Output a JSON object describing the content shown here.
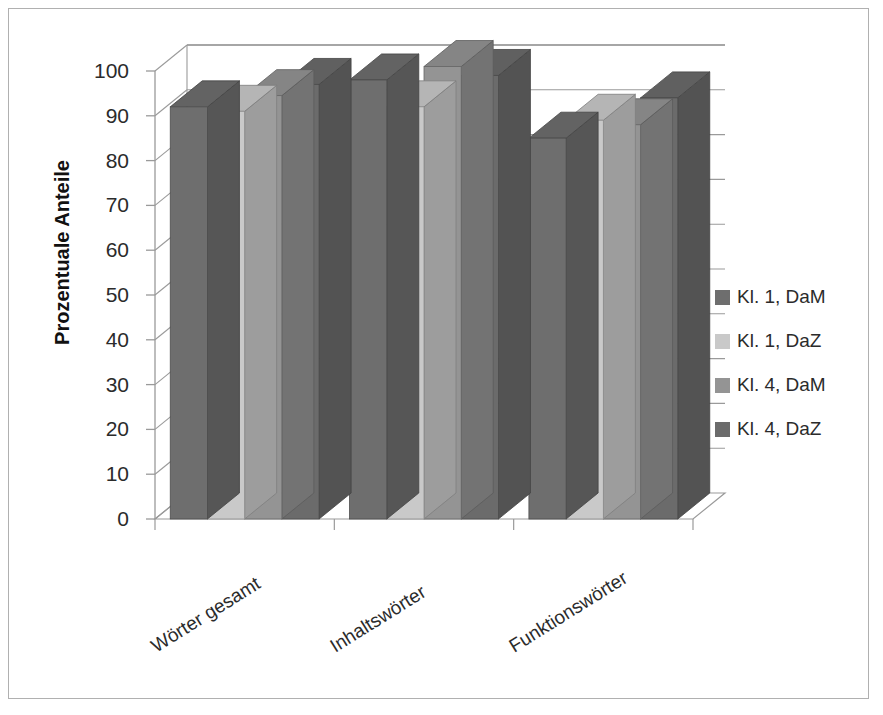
{
  "chart_data": {
    "type": "bar",
    "title": "",
    "subtitle": "",
    "xlabel": "",
    "ylabel": "Prozentuale Anteile",
    "ylim": [
      0,
      100
    ],
    "yticks": [
      100,
      90,
      80,
      70,
      60,
      50,
      40,
      30,
      20,
      10,
      0
    ],
    "grid": true,
    "three_d": true,
    "legend_position": "right",
    "categories": [
      "Wörter gesamt",
      "Inhaltswörter",
      "Funktionswörter"
    ],
    "series": [
      {
        "name": "Kl. 1, DaM",
        "color": "#6e6e6e",
        "values": [
          92,
          98,
          85
        ]
      },
      {
        "name": "Kl. 1, DaZ",
        "color": "#c9c9c9",
        "values": [
          91,
          92,
          89
        ]
      },
      {
        "name": "Kl. 4, DaM",
        "color": "#949494",
        "values": [
          94.5,
          101,
          88
        ]
      },
      {
        "name": "Kl. 4, DaZ",
        "color": "#6b6b6b",
        "values": [
          97,
          99,
          94
        ]
      }
    ]
  },
  "axis": {
    "y_title": "Prozentuale Anteile",
    "y_tick_labels": [
      "100",
      "90",
      "80",
      "70",
      "60",
      "50",
      "40",
      "30",
      "20",
      "10",
      "0"
    ],
    "x_tick_labels": [
      "Wörter gesamt",
      "Inhaltswörter",
      "Funktionswörter"
    ]
  },
  "legend": {
    "items": [
      {
        "label": "Kl. 1, DaM",
        "color": "#6e6e6e"
      },
      {
        "label": "Kl. 1, DaZ",
        "color": "#c9c9c9"
      },
      {
        "label": "Kl. 4, DaM",
        "color": "#949494"
      },
      {
        "label": "Kl. 4, DaZ",
        "color": "#6b6b6b"
      }
    ]
  },
  "style": {
    "frame_border": "#b0b0b0",
    "axis_line": "#9a9a9a",
    "gridline": "#9a9a9a",
    "background": "#ffffff",
    "text": "#2b2b2b"
  }
}
